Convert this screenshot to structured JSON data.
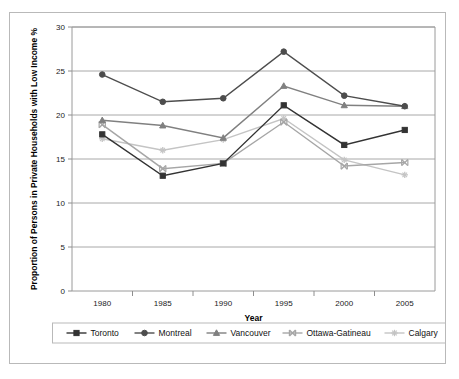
{
  "chart_data": {
    "type": "line",
    "title": "",
    "xlabel": "Year",
    "ylabel": "Proportion of Persons in Private Households with Low Income %",
    "categories": [
      "1980",
      "1985",
      "1990",
      "1995",
      "2000",
      "2005"
    ],
    "x": [
      1980,
      1985,
      1990,
      1995,
      2000,
      2005
    ],
    "xlim": [
      1977.5,
      2007.5
    ],
    "ylim": [
      0,
      30
    ],
    "yticks": [
      0,
      5,
      10,
      15,
      20,
      25,
      30
    ],
    "grid": "horizontal",
    "legend_position": "bottom",
    "series": [
      {
        "name": "Toronto",
        "marker": "square",
        "color": "#333333",
        "values": [
          17.8,
          13.1,
          14.5,
          21.1,
          16.6,
          18.3
        ]
      },
      {
        "name": "Montreal",
        "marker": "circle",
        "color": "#4d4d4d",
        "values": [
          24.6,
          21.5,
          21.9,
          27.2,
          22.2,
          21.0
        ]
      },
      {
        "name": "Vancouver",
        "marker": "triangle",
        "color": "#808080",
        "values": [
          19.4,
          18.8,
          17.4,
          23.3,
          21.1,
          21.0
        ]
      },
      {
        "name": "Ottawa-Gatineau",
        "marker": "x",
        "color": "#a6a6a6",
        "values": [
          18.9,
          13.9,
          14.5,
          19.2,
          14.2,
          14.6
        ]
      },
      {
        "name": "Calgary",
        "marker": "asterisk",
        "color": "#c4c4c4",
        "values": [
          17.3,
          16.0,
          17.2,
          19.6,
          14.9,
          13.2
        ]
      }
    ]
  }
}
